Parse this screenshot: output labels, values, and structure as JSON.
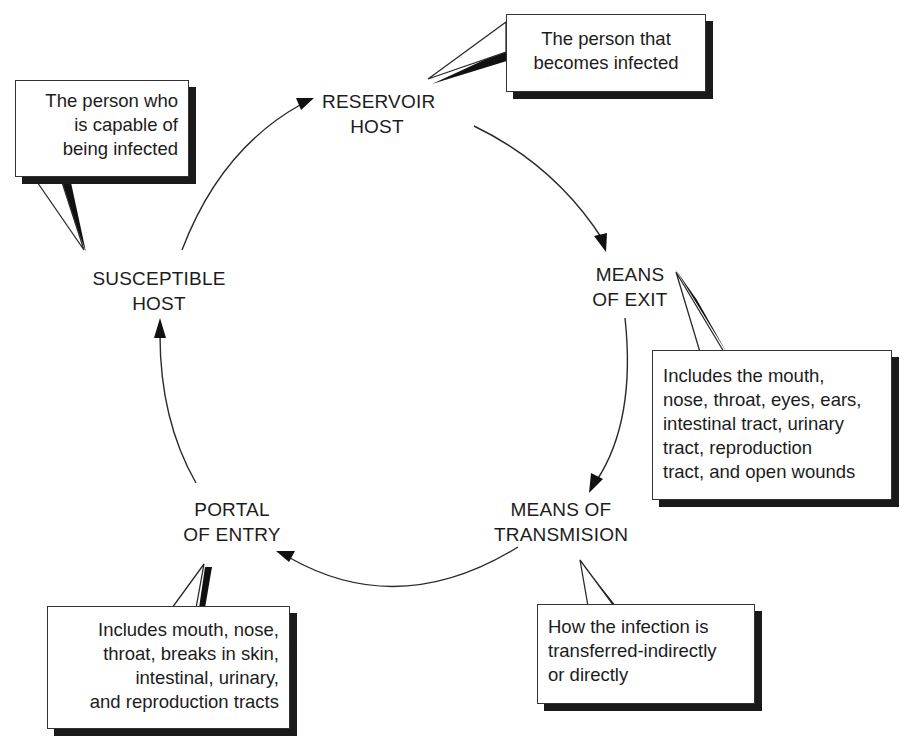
{
  "diagram": {
    "nodes": {
      "reservoir": {
        "line1": "RESERVOIR",
        "line2": "HOST"
      },
      "exit": {
        "line1": "MEANS",
        "line2": "OF EXIT"
      },
      "transmission": {
        "line1": "MEANS OF",
        "line2": "TRANSMISION"
      },
      "entry": {
        "line1": "PORTAL",
        "line2": "OF ENTRY"
      },
      "susceptible": {
        "line1": "SUSCEPTIBLE",
        "line2": "HOST"
      }
    },
    "callouts": {
      "reservoir": {
        "lines": [
          "The person that",
          "becomes infected"
        ]
      },
      "susceptible": {
        "lines": [
          "The person who",
          "is capable of",
          "being infected"
        ]
      },
      "exit": {
        "lines": [
          "Includes the mouth,",
          "nose, throat, eyes, ears,",
          "intestinal tract, urinary",
          "tract, reproduction",
          "tract, and open wounds"
        ]
      },
      "transmission": {
        "lines": [
          "How the infection is",
          "transferred-indirectly",
          "or directly"
        ]
      },
      "entry": {
        "lines": [
          "Includes mouth, nose,",
          "throat, breaks in skin,",
          "intestinal, urinary,",
          "and reproduction tracts"
        ]
      }
    },
    "edges": [
      {
        "from": "RESERVOIR HOST",
        "to": "MEANS OF EXIT"
      },
      {
        "from": "MEANS OF EXIT",
        "to": "MEANS OF TRANSMISION"
      },
      {
        "from": "MEANS OF TRANSMISION",
        "to": "PORTAL OF ENTRY"
      },
      {
        "from": "PORTAL OF ENTRY",
        "to": "SUSCEPTIBLE HOST"
      },
      {
        "from": "SUSCEPTIBLE HOST",
        "to": "RESERVOIR HOST"
      }
    ],
    "colors": {
      "line": "#2a2a2a",
      "shadow": "#1a1a1a",
      "background": "#ffffff"
    }
  }
}
